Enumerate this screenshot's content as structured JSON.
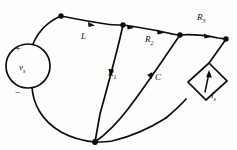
{
  "figure": {
    "type": "electrical-circuit-graph",
    "style": "hand-drawn line drawing, black ink on off-white paper",
    "background_color": "#fdfdfb",
    "line_color": "#0d0d0d"
  },
  "labels": {
    "voltage_source": "v",
    "voltage_source_sub": "s",
    "inductor": "L",
    "resistor1": "R",
    "resistor1_sub": "1",
    "resistor2": "R",
    "resistor2_sub": "2",
    "resistor3": "R",
    "resistor3_sub": "3",
    "capacitor": "C",
    "current_source": "i",
    "current_source_sub": "s",
    "plus_sign": "+",
    "minus_sign": "−"
  },
  "elements": [
    {
      "name": "voltage-source",
      "kind": "independent-voltage-source",
      "symbol": "circle",
      "label": "v_s",
      "polarity_top": "+",
      "polarity_bottom": "−"
    },
    {
      "name": "inductor",
      "kind": "inductor",
      "label": "L",
      "branch": "node-top-left to node-top-mid"
    },
    {
      "name": "resistor-1",
      "kind": "resistor",
      "label": "R_1",
      "branch": "node-top-mid to node-bottom"
    },
    {
      "name": "resistor-2",
      "kind": "resistor",
      "label": "R_2",
      "branch": "node-top-mid to node-top-right"
    },
    {
      "name": "capacitor",
      "kind": "capacitor",
      "label": "C",
      "branch": "node-top-right to node-bottom"
    },
    {
      "name": "resistor-3",
      "kind": "resistor",
      "label": "R_3",
      "branch": "node-top-right to node-far-right"
    },
    {
      "name": "current-source",
      "kind": "independent-current-source",
      "symbol": "diamond",
      "label": "i_s",
      "branch": "node-far-right to node-bottom"
    }
  ],
  "nodes": [
    {
      "name": "node-top-left",
      "x": 61,
      "y": 16
    },
    {
      "name": "node-top-mid",
      "x": 123,
      "y": 25
    },
    {
      "name": "node-top-right",
      "x": 180,
      "y": 35
    },
    {
      "name": "node-far-right",
      "x": 226,
      "y": 39
    },
    {
      "name": "node-bottom",
      "x": 95,
      "y": 142
    }
  ]
}
